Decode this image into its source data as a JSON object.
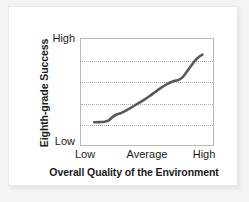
{
  "figure": {
    "background_color": "#f3f3f3",
    "card_color": "#ffffff",
    "frame_color": "#b9b9b9",
    "grid_color": "#a9a9a9",
    "line_color": "#59595b"
  },
  "chart_data": {
    "type": "line",
    "title": "",
    "xlabel": "Overall Quality of the Environment",
    "ylabel": "Eighth-grade Success",
    "x_tick_labels": [
      "Low",
      "Average",
      "High"
    ],
    "x_tick_positions": [
      0.1,
      0.5,
      0.9
    ],
    "y_tick_labels": [
      "Low",
      "High"
    ],
    "y_tick_positions": [
      0.0,
      1.0
    ],
    "xlim": [
      0,
      1
    ],
    "ylim": [
      0,
      1
    ],
    "grid": true,
    "grid_axis": "y",
    "grid_lines": [
      0.2,
      0.4,
      0.6,
      0.8
    ],
    "legend": "none",
    "series": [
      {
        "name": "Eighth-grade Success",
        "line_color": "#59595b",
        "line_width": 2.6,
        "x": [
          0.1,
          0.14,
          0.18,
          0.21,
          0.24,
          0.27,
          0.3,
          0.33,
          0.36,
          0.4,
          0.44,
          0.48,
          0.52,
          0.56,
          0.6,
          0.64,
          0.68,
          0.71,
          0.74,
          0.77,
          0.8,
          0.83,
          0.86,
          0.89,
          0.92
        ],
        "y": [
          0.215,
          0.216,
          0.22,
          0.232,
          0.265,
          0.288,
          0.3,
          0.318,
          0.338,
          0.368,
          0.398,
          0.428,
          0.462,
          0.498,
          0.534,
          0.566,
          0.592,
          0.606,
          0.614,
          0.64,
          0.688,
          0.74,
          0.79,
          0.828,
          0.852
        ]
      }
    ]
  },
  "labels": {
    "y_axis_title": "Eighth-grade Success",
    "y_tick_high": "High",
    "y_tick_low": "Low",
    "x_tick_low": "Low",
    "x_tick_average": "Average",
    "x_tick_high": "High",
    "x_axis_title": "Overall Quality of the Environment"
  }
}
